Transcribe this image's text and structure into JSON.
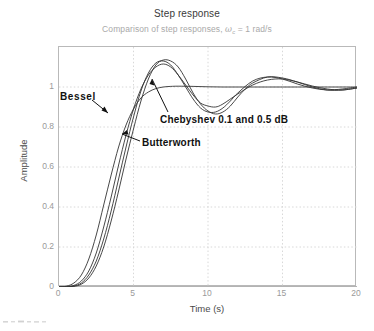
{
  "chart_data": {
    "type": "line",
    "title": "Step response",
    "subtitle_prefix": "Comparison of step responses, ",
    "subtitle_omega": "ω",
    "subtitle_omega_sub": "c",
    "subtitle_suffix": " = 1 rad/s",
    "xlabel": "Time (s)",
    "ylabel": "Amplitude",
    "xlim": [
      0,
      20
    ],
    "ylim": [
      0,
      1.2
    ],
    "xticks": [
      "0",
      "5",
      "10",
      "15",
      "20"
    ],
    "xtick_values": [
      0,
      5,
      10,
      15,
      20
    ],
    "yticks": [
      "0",
      "0.2",
      "0.4",
      "0.6",
      "0.8",
      "1"
    ],
    "ytick_values": [
      0,
      0.2,
      0.4,
      0.6,
      0.8,
      1
    ],
    "grid": true,
    "legend": "none",
    "line_color": "#333333",
    "grid_color": "#d8d8d8",
    "frame_color": "#b9b9b9",
    "series": [
      {
        "name": "Bessel",
        "x": [
          0,
          0.5,
          1,
          1.5,
          2,
          2.5,
          3,
          3.5,
          4,
          4.5,
          5,
          5.5,
          6,
          6.5,
          7,
          7.5,
          8,
          9,
          10,
          11,
          12,
          13,
          14,
          15,
          16,
          17,
          18,
          19,
          20
        ],
        "values": [
          0,
          0.004,
          0.02,
          0.06,
          0.14,
          0.26,
          0.41,
          0.56,
          0.7,
          0.81,
          0.89,
          0.945,
          0.975,
          0.992,
          1.0,
          1.003,
          1.004,
          1.003,
          1.001,
          1.0,
          1.0,
          1.0,
          1.0,
          1.0,
          1.0,
          1.0,
          1.0,
          1.0,
          1.0
        ]
      },
      {
        "name": "Butterworth",
        "x": [
          0,
          0.5,
          1,
          1.5,
          2,
          2.5,
          3,
          3.5,
          4,
          4.5,
          5,
          5.5,
          6,
          6.5,
          7,
          7.5,
          8,
          8.5,
          9,
          9.5,
          10,
          10.5,
          11,
          12,
          13,
          14,
          15,
          16,
          17,
          18,
          19,
          20
        ],
        "values": [
          0,
          0.001,
          0.008,
          0.03,
          0.08,
          0.17,
          0.3,
          0.45,
          0.61,
          0.76,
          0.89,
          0.99,
          1.06,
          1.1,
          1.115,
          1.1,
          1.06,
          1.01,
          0.96,
          0.92,
          0.905,
          0.9,
          0.915,
          0.965,
          1.01,
          1.035,
          1.04,
          1.025,
          1.005,
          0.99,
          0.985,
          0.995
        ]
      },
      {
        "name": "Chebyshev 0.1 dB",
        "x": [
          0,
          0.5,
          1,
          1.5,
          2,
          2.5,
          3,
          3.5,
          4,
          4.5,
          5,
          5.5,
          6,
          6.5,
          7,
          7.5,
          8,
          8.5,
          9,
          9.5,
          10,
          10.5,
          11,
          11.5,
          12,
          13,
          14,
          15,
          16,
          17,
          18,
          19,
          20
        ],
        "values": [
          0,
          0.0005,
          0.005,
          0.02,
          0.06,
          0.13,
          0.24,
          0.38,
          0.54,
          0.7,
          0.85,
          0.98,
          1.07,
          1.12,
          1.13,
          1.11,
          1.06,
          1.0,
          0.94,
          0.895,
          0.875,
          0.875,
          0.895,
          0.93,
          0.97,
          1.03,
          1.05,
          1.04,
          1.015,
          0.995,
          0.985,
          0.99,
          1.0
        ]
      },
      {
        "name": "Chebyshev 0.5 dB",
        "x": [
          0,
          0.5,
          1,
          1.5,
          2,
          2.5,
          3,
          3.5,
          4,
          4.5,
          5,
          5.5,
          6,
          6.5,
          7,
          7.5,
          8,
          8.5,
          9,
          9.5,
          10,
          10.5,
          11,
          11.5,
          12,
          12.5,
          13,
          14,
          15,
          16,
          17,
          18,
          19,
          20
        ],
        "values": [
          0,
          0.0003,
          0.003,
          0.014,
          0.045,
          0.105,
          0.2,
          0.33,
          0.48,
          0.64,
          0.79,
          0.93,
          1.04,
          1.11,
          1.135,
          1.13,
          1.1,
          1.04,
          0.97,
          0.915,
          0.88,
          0.865,
          0.875,
          0.905,
          0.95,
          0.99,
          1.02,
          1.05,
          1.045,
          1.025,
          1.0,
          0.985,
          0.985,
          0.995
        ]
      }
    ],
    "annotations": [
      {
        "label": "Bessel",
        "target_series": "Bessel"
      },
      {
        "label": "Chebyshev 0.1 and 0.5 dB",
        "target_series": "Chebyshev"
      },
      {
        "label": "Butterworth",
        "target_series": "Butterworth"
      }
    ]
  }
}
